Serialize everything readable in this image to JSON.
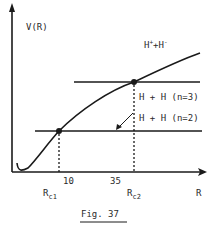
{
  "figure": {
    "caption": "Fig. 37",
    "y_axis_label": "V(R)",
    "x_axis_label": "R",
    "curve_label": {
      "base1": "H",
      "sup1": "+",
      "plus": "+",
      "base2": "H",
      "sup2": "-"
    },
    "levels": [
      {
        "label": "H + H (n=3)"
      },
      {
        "label": "H + H (n=2)"
      }
    ],
    "crossings": [
      {
        "base": "R",
        "sub": "c1",
        "tick": "10"
      },
      {
        "base": "R",
        "sub": "c2",
        "tick": "35"
      }
    ],
    "colors": {
      "ink": "#1a1a1a",
      "background": "#ffffff"
    }
  }
}
